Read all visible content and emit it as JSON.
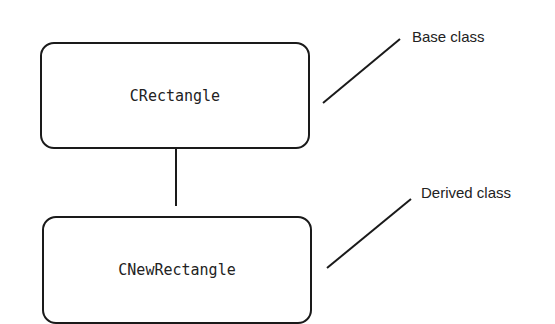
{
  "diagram": {
    "nodes": [
      {
        "id": "base",
        "label": "CRectangle"
      },
      {
        "id": "derived",
        "label": "CNewRectangle"
      }
    ],
    "edges": [
      {
        "from": "derived",
        "to": "base",
        "type": "inheritance"
      }
    ],
    "annotations": [
      {
        "target": "base",
        "text": "Base class"
      },
      {
        "target": "derived",
        "text": "Derived class"
      }
    ]
  }
}
